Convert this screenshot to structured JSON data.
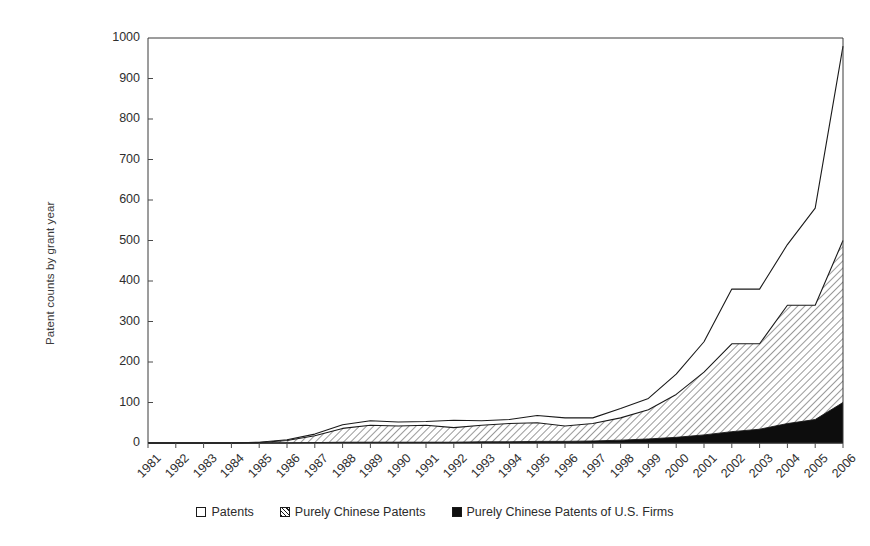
{
  "chart_data": {
    "type": "area",
    "title": "",
    "xlabel": "",
    "ylabel": "Patent counts by grant year",
    "ylim": [
      0,
      1000
    ],
    "ytick_values": [
      0,
      100,
      200,
      300,
      400,
      500,
      600,
      700,
      800,
      900,
      1000
    ],
    "ytick_labels": [
      "0",
      "100",
      "200",
      "300",
      "400",
      "500",
      "600",
      "700",
      "800",
      "900",
      "1000"
    ],
    "grid": false,
    "legend_position": "bottom",
    "categories": [
      "1981",
      "1982",
      "1983",
      "1984",
      "1985",
      "1986",
      "1987",
      "1988",
      "1989",
      "1990",
      "1991",
      "1992",
      "1993",
      "1994",
      "1995",
      "1996",
      "1997",
      "1998",
      "1999",
      "2000",
      "2001",
      "2002",
      "2003",
      "2004",
      "2005",
      "2006"
    ],
    "series": [
      {
        "name": "Patents",
        "fill": "white",
        "values": [
          0,
          0,
          0,
          0,
          2,
          8,
          22,
          45,
          55,
          52,
          53,
          56,
          55,
          58,
          68,
          62,
          62,
          85,
          110,
          170,
          250,
          380,
          380,
          490,
          580,
          980
        ]
      },
      {
        "name": "Purely Chinese Patents",
        "fill": "hatched",
        "values": [
          0,
          0,
          0,
          0,
          1,
          6,
          18,
          36,
          44,
          42,
          44,
          38,
          44,
          48,
          50,
          42,
          48,
          62,
          82,
          120,
          175,
          245,
          245,
          340,
          340,
          500
        ]
      },
      {
        "name": "Purely Chinese Patents of U.S. Firms",
        "fill": "black",
        "values": [
          0,
          0,
          0,
          0,
          0,
          0,
          1,
          2,
          2,
          2,
          2,
          2,
          3,
          3,
          4,
          4,
          5,
          7,
          10,
          14,
          20,
          28,
          34,
          48,
          58,
          100
        ]
      }
    ]
  },
  "legend": {
    "items": [
      {
        "label": "Patents",
        "swatch": "white-square"
      },
      {
        "label": "Purely Chinese Patents",
        "swatch": "hatched-square"
      },
      {
        "label": "Purely Chinese Patents of U.S. Firms",
        "swatch": "black-square"
      }
    ]
  },
  "axes": {
    "plot_left_px": 148,
    "plot_right_px": 843,
    "plot_top_px": 38,
    "plot_bottom_px": 443
  }
}
